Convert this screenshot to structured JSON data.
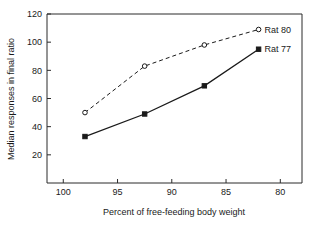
{
  "chart_data": {
    "type": "line",
    "title": "",
    "xlabel": "Percent of  free-feeding body weight",
    "ylabel": "Median responses in final ratio",
    "xlim": [
      101.5,
      78.0
    ],
    "ylim": [
      0,
      120
    ],
    "x_ticks": [
      100,
      95,
      90,
      85,
      80
    ],
    "x_tick_labels": [
      "100",
      "95",
      "90",
      "85",
      "80"
    ],
    "y_ticks": [
      20,
      40,
      60,
      80,
      100,
      120
    ],
    "y_tick_labels": [
      "20",
      "40",
      "60",
      "80",
      "100",
      "120"
    ],
    "x_axis_reversed": true,
    "grid": false,
    "legend_position": "inline-right-of-last-point",
    "series": [
      {
        "name": "Rat 80",
        "label": "Rat 80",
        "marker": "open-circle",
        "linestyle": "dashed",
        "color": "#1a1a1a",
        "x": [
          98.0,
          92.5,
          87.0,
          82.0
        ],
        "values": [
          50,
          83,
          98,
          109
        ]
      },
      {
        "name": "Rat 77",
        "label": "Rat 77",
        "marker": "filled-square",
        "linestyle": "solid",
        "color": "#1a1a1a",
        "x": [
          98.0,
          92.5,
          87.0,
          82.0
        ],
        "values": [
          33,
          49,
          69,
          95
        ]
      }
    ]
  },
  "figure": {
    "background": "#ffffff",
    "axis_color": "#2b2b2b"
  }
}
